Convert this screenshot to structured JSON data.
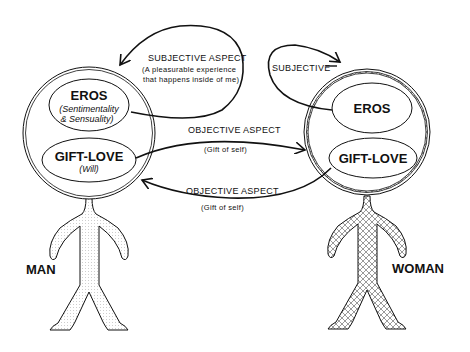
{
  "diagram": {
    "man": {
      "label": "MAN",
      "eros": {
        "title": "EROS",
        "subtitle_line1": "(Sentimentality",
        "subtitle_line2": "& Sensuality)"
      },
      "gift_love": {
        "title": "GIFT-LOVE",
        "subtitle": "(Will)"
      }
    },
    "woman": {
      "label": "WOMAN",
      "eros": {
        "title": "EROS"
      },
      "gift_love": {
        "title": "GIFT-LOVE"
      }
    },
    "arrows": {
      "subjective_aspect": {
        "title": "SUBJECTIVE ASPECT",
        "line1": "(A pleasurable experience",
        "line2": "that happens inside of me)"
      },
      "subjective": {
        "title": "SUBJECTIVE"
      },
      "objective_top": {
        "title": "OBJECTIVE ASPECT",
        "sub": "(Gift of self)"
      },
      "objective_bottom": {
        "title": "OBJECTIVE ASPECT",
        "sub": "(Gift of self)"
      }
    },
    "colors": {
      "stroke": "#111111",
      "background": "#ffffff"
    }
  }
}
